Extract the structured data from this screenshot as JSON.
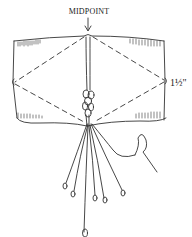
{
  "diagram": {
    "labels": {
      "midpoint": "MIDPOINT",
      "dimension": "1½\""
    },
    "colors": {
      "ink": "#333333",
      "background": "#ffffff"
    }
  }
}
